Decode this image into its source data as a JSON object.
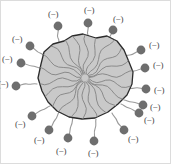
{
  "figure": {
    "canvas": {
      "width": 171,
      "height": 164
    },
    "colors": {
      "background": "#ffffff",
      "particle_fill": "#c9c9c9",
      "particle_stroke": "#2b2b2b",
      "hair_stroke": "#8a8a8a",
      "dot_fill": "#6e6e6e",
      "tail_stroke": "#9a9a9a",
      "label_text": "#4a4a4a",
      "frame_border": "#d8d8d8"
    },
    "charge_symbol": "(−)",
    "particle": {
      "label": "colloid-core",
      "outline_points": "41,64 44,52 53,44 64,41 72,36 83,34 96,38 107,36 117,41 124,50 129,62 133,72 132,84 127,95 118,104 108,112 95,118 82,119 69,117 57,111 48,102 42,91 38,78",
      "hair_count": 22
    },
    "charges": [
      {
        "id": "charge-1",
        "dot": {
          "cx": 58,
          "cy": 26
        },
        "label_pos": {
          "x": 53,
          "y": 14
        },
        "tail": "M58,26 C60,31 56,34 58,38 C60,41 58,43 60,45"
      },
      {
        "id": "charge-2",
        "dot": {
          "cx": 88,
          "cy": 23
        },
        "label_pos": {
          "x": 89,
          "y": 10
        },
        "tail": "M88,23 C90,28 86,31 88,35 C90,38 87,40 89,44"
      },
      {
        "id": "charge-3",
        "dot": {
          "cx": 113,
          "cy": 30
        },
        "label_pos": {
          "x": 118,
          "y": 19
        },
        "tail": "M113,30 C112,35 108,37 109,41 C110,45 106,46 106,50"
      },
      {
        "id": "charge-4",
        "dot": {
          "cx": 30,
          "cy": 46
        },
        "label_pos": {
          "x": 17,
          "y": 39
        },
        "tail": "M30,46 C35,48 36,52 40,53 C44,54 44,57 47,58"
      },
      {
        "id": "charge-5",
        "dot": {
          "cx": 21,
          "cy": 63
        },
        "label_pos": {
          "x": 7,
          "y": 59
        },
        "tail": "M21,63 C26,63 28,66 32,66 C36,66 37,68 41,68"
      },
      {
        "id": "charge-6",
        "dot": {
          "cx": 16,
          "cy": 86
        },
        "label_pos": {
          "x": 3,
          "y": 84
        },
        "tail": "M16,86 C21,86 23,83 27,84 C31,85 33,83 37,84"
      },
      {
        "id": "charge-7",
        "dot": {
          "cx": 141,
          "cy": 50
        },
        "label_pos": {
          "x": 154,
          "y": 45
        },
        "tail": "M141,50 C136,51 134,55 130,55 C126,55 125,57 122,57"
      },
      {
        "id": "charge-8",
        "dot": {
          "cx": 145,
          "cy": 68
        },
        "label_pos": {
          "x": 158,
          "y": 65
        },
        "tail": "M145,68 C140,68 138,71 134,71 C130,71 128,72 125,72"
      },
      {
        "id": "charge-9",
        "dot": {
          "cx": 146,
          "cy": 89
        },
        "label_pos": {
          "x": 159,
          "y": 90
        },
        "tail": "M146,89 C141,89 139,87 135,88 C131,89 129,88 126,89"
      },
      {
        "id": "charge-10",
        "dot": {
          "cx": 32,
          "cy": 116
        },
        "label_pos": {
          "x": 20,
          "y": 124
        },
        "tail": "M32,116 C37,114 38,111 42,110 C46,109 47,107 50,106"
      },
      {
        "id": "charge-11",
        "dot": {
          "cx": 49,
          "cy": 130
        },
        "label_pos": {
          "x": 39,
          "y": 140
        },
        "tail": "M49,130 C53,127 52,123 55,120 C58,117 57,115 59,112"
      },
      {
        "id": "charge-12",
        "dot": {
          "cx": 68,
          "cy": 138
        },
        "label_pos": {
          "x": 61,
          "y": 151
        },
        "tail": "M68,138 C71,134 69,130 71,126 C73,122 72,120 73,117"
      },
      {
        "id": "charge-13",
        "dot": {
          "cx": 94,
          "cy": 141
        },
        "label_pos": {
          "x": 93,
          "y": 153
        },
        "tail": "M94,141 C96,137 93,133 95,129 C97,125 95,123 96,119"
      },
      {
        "id": "charge-14",
        "dot": {
          "cx": 124,
          "cy": 130
        },
        "label_pos": {
          "x": 133,
          "y": 139
        },
        "tail": "M124,130 C122,126 118,125 117,121 C116,117 113,116 112,113"
      },
      {
        "id": "charge-15",
        "dot": {
          "cx": 139,
          "cy": 113
        },
        "label_pos": {
          "x": 149,
          "y": 120
        },
        "tail": "M139,113 C135,112 133,109 129,108 C125,107 124,105 121,104"
      },
      {
        "id": "charge-16",
        "dot": {
          "cx": 143,
          "cy": 105
        },
        "label_pos": {
          "x": 155,
          "y": 107
        },
        "tail": "M143,105 C139,104 136,102 132,102 C128,102 127,100 124,100"
      }
    ]
  }
}
